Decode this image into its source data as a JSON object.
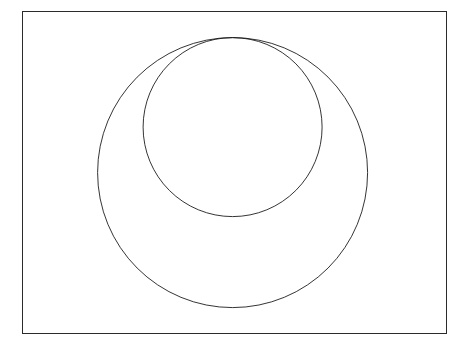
{
  "page": {
    "width": 473,
    "height": 350,
    "background_color": "#ffffff"
  },
  "frame": {
    "x": 22,
    "y": 11,
    "width": 425,
    "height": 323,
    "border_width": 1.4,
    "border_color": "#2b2b2b",
    "fill_color": "#ffffff"
  },
  "figure": {
    "name": "apollonian-gasket-crescent",
    "stroke_color": "#111111",
    "stroke_width": 0.85,
    "fill_color": "none",
    "outer_circle": {
      "cx": 233,
      "cy": 173,
      "r": 135
    },
    "inner_circle": {
      "cx": 233.5,
      "cy": 128,
      "r": 89.5
    },
    "tangency_point": {
      "x": 233,
      "y": 38.5
    },
    "max_depth": 9,
    "min_radius_px": 0.55,
    "seed_count": 3
  },
  "chart_data": {
    "type": "diagram",
    "title": "",
    "bounding_circles": [
      {
        "role": "outer-boundary",
        "cx": 233,
        "cy": 173,
        "r": 135,
        "curvature": -0.0074
      },
      {
        "role": "inner-boundary",
        "cx": 233.5,
        "cy": 128,
        "r": 89.5,
        "curvature": 0.0112
      }
    ],
    "largest_inscribed_circles": [
      {
        "cx": 233,
        "cy": 278,
        "r": 30
      },
      {
        "cx": 150,
        "cy": 240,
        "r": 26
      },
      {
        "cx": 316,
        "cy": 240,
        "r": 26
      },
      {
        "cx": 132,
        "cy": 182,
        "r": 22
      },
      {
        "cx": 334,
        "cy": 182,
        "r": 22
      },
      {
        "cx": 192,
        "cy": 231,
        "r": 19
      },
      {
        "cx": 274,
        "cy": 231,
        "r": 19
      },
      {
        "cx": 233,
        "cy": 226,
        "r": 17
      }
    ]
  }
}
